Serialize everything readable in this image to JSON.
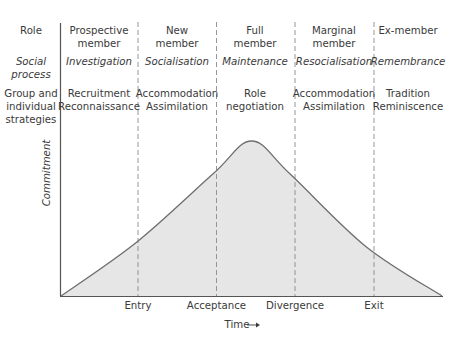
{
  "row_headers": {
    "role": [
      "Role"
    ],
    "social_process": [
      "Social",
      "process"
    ],
    "strategies": [
      "Group and",
      "individual",
      "strategies"
    ]
  },
  "phases": [
    {
      "role": [
        "Prospective",
        "member"
      ],
      "process": "Investigation",
      "strategies": [
        "Recruitment",
        "Reconnaissance"
      ]
    },
    {
      "role": [
        "New",
        "member"
      ],
      "process": "Socialisation",
      "strategies": [
        "Accommodation",
        "Assimilation"
      ]
    },
    {
      "role": [
        "Full",
        "member"
      ],
      "process": "Maintenance",
      "strategies": [
        "Role",
        "negotiation"
      ]
    },
    {
      "role": [
        "Marginal",
        "member"
      ],
      "process": "Resocialisation",
      "strategies": [
        "Accommodation",
        "Assimilation"
      ]
    },
    {
      "role": [
        "Ex-member"
      ],
      "process": "Remembrance",
      "strategies": [
        "Tradition",
        "Reminiscence"
      ]
    }
  ],
  "transitions": [
    "Entry",
    "Acceptance",
    "Divergence",
    "Exit"
  ],
  "axes": {
    "y_label": "Commitment",
    "x_label": "Time",
    "x_arrow": "→"
  },
  "colors": {
    "fill": "#e6e6e6",
    "line": "#6e6e6e",
    "dash": "#8a8a8a",
    "text": "#3a3a3a"
  },
  "curve": {
    "description": "Commitment rises over time, peaks during full membership, then declines to zero after exit",
    "points_relative": [
      {
        "t": 0.0,
        "commitment": 0.0
      },
      {
        "t": 0.2,
        "commitment": 0.35
      },
      {
        "t": 0.4,
        "commitment": 0.79
      },
      {
        "t": 0.5,
        "commitment": 1.0
      },
      {
        "t": 0.6,
        "commitment": 0.79
      },
      {
        "t": 0.8,
        "commitment": 0.32
      },
      {
        "t": 1.0,
        "commitment": 0.0
      }
    ]
  }
}
